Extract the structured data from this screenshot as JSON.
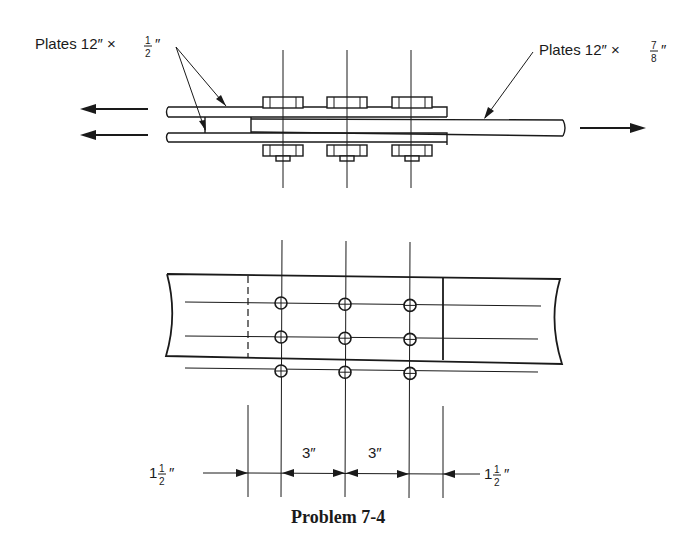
{
  "labels": {
    "left_plates": {
      "prefix": "Plates 12″ × ",
      "num": "1",
      "den": "2",
      "suffix": "″"
    },
    "right_plates": {
      "prefix": "Plates 12″ × ",
      "num": "7",
      "den": "8",
      "suffix": "″"
    }
  },
  "dimensions": {
    "edge_left": {
      "whole": "1",
      "num": "1",
      "den": "2",
      "unit": "″"
    },
    "pitch_1": "3″",
    "pitch_2": "3″",
    "edge_right": {
      "whole": "1",
      "num": "1",
      "den": "2",
      "unit": "″"
    }
  },
  "bolts": {
    "rows": 3,
    "columns": 3
  },
  "caption": "Problem 7-4"
}
